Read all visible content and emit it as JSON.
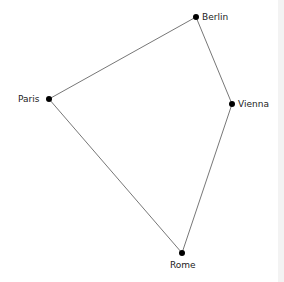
{
  "diagram": {
    "type": "graph",
    "nodes": [
      {
        "id": "berlin",
        "label": "Berlin",
        "x": 196,
        "y": 17
      },
      {
        "id": "paris",
        "label": "Paris",
        "x": 49,
        "y": 99
      },
      {
        "id": "vienna",
        "label": "Vienna",
        "x": 232,
        "y": 104
      },
      {
        "id": "rome",
        "label": "Rome",
        "x": 182,
        "y": 253
      }
    ],
    "edges": [
      [
        "paris",
        "berlin"
      ],
      [
        "berlin",
        "vienna"
      ],
      [
        "vienna",
        "rome"
      ],
      [
        "rome",
        "paris"
      ]
    ],
    "colors": {
      "edge": "#777777",
      "node": "#000000"
    }
  }
}
